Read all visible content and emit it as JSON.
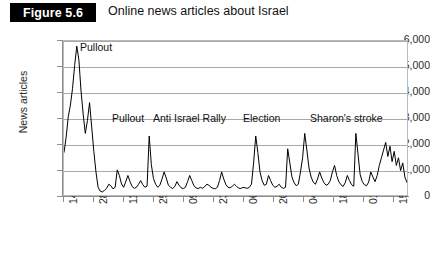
{
  "header": {
    "figure_badge": "Figure 5.6",
    "title": "Online news articles about Israel"
  },
  "chart_data": {
    "type": "line",
    "title": "Online news articles about Israel",
    "xlabel": "",
    "ylabel": "News articles",
    "ylim": [
      0,
      6000
    ],
    "ytick_labels": [
      "0",
      "1,000",
      "2,000",
      "3,000",
      "4,000",
      "5,000",
      "6,000"
    ],
    "ytick_values": [
      0,
      1000,
      2000,
      3000,
      4000,
      5000,
      6000
    ],
    "grid": "horizontal",
    "legend": "none",
    "xtick_labels": [
      "14/08/2005",
      "28/08/2005",
      "11/09/2005",
      "25/09/2005",
      "09/10/2005",
      "23/10/2005",
      "06/11/2005",
      "20/11/2005",
      "04/12/2005",
      "18/12/2005",
      "01/01/2006",
      "15/01/2006"
    ],
    "x_interval_days": 14,
    "x_start": "14/08/2005",
    "x_end": "22/01/2006",
    "n_points": 162,
    "series": [
      {
        "name": "News articles",
        "color": "#000000",
        "values": [
          1650,
          2250,
          3050,
          3500,
          4150,
          5050,
          5800,
          5250,
          4050,
          3150,
          2400,
          2900,
          3600,
          2650,
          1700,
          900,
          300,
          150,
          120,
          180,
          260,
          420,
          360,
          240,
          300,
          980,
          760,
          430,
          300,
          520,
          760,
          520,
          330,
          260,
          300,
          420,
          560,
          400,
          300,
          350,
          2300,
          1180,
          640,
          420,
          300,
          380,
          620,
          900,
          660,
          380,
          300,
          250,
          330,
          520,
          380,
          280,
          250,
          300,
          520,
          760,
          560,
          360,
          280,
          250,
          300,
          260,
          320,
          420,
          380,
          300,
          260,
          240,
          300,
          560,
          900,
          620,
          400,
          300,
          280,
          340,
          420,
          330,
          270,
          250,
          300,
          280,
          260,
          300,
          420,
          1250,
          2300,
          1650,
          900,
          560,
          380,
          420,
          760,
          560,
          380,
          300,
          340,
          420,
          300,
          260,
          300,
          1800,
          1250,
          700,
          480,
          360,
          420,
          900,
          1450,
          2400,
          1750,
          1050,
          700,
          500,
          420,
          620,
          900,
          660,
          480,
          380,
          420,
          560,
          900,
          1150,
          760,
          520,
          400,
          330,
          480,
          760,
          560,
          400,
          340,
          2400,
          1600,
          800,
          520,
          400,
          360,
          500,
          900,
          700,
          520,
          760,
          1150,
          1450,
          1750,
          2050,
          1500,
          1900,
          1300,
          1700,
          1150,
          1450,
          950,
          1250,
          700,
          480
        ]
      }
    ],
    "annotations": [
      {
        "label": "Pullout",
        "x_index": 7,
        "y_value": 5800
      },
      {
        "label": "Pullout",
        "x_index": 40,
        "y_value": 2300
      },
      {
        "label": "Anti Israel Rally",
        "x_index": 90,
        "y_value": 2300
      },
      {
        "label": "Election",
        "x_index": 113,
        "y_value": 2400
      },
      {
        "label": "Sharon's stroke",
        "x_index": 137,
        "y_value": 2400
      }
    ]
  },
  "annotation_layout": [
    {
      "name": "annot-pullout-1",
      "left": 80,
      "top": 15
    },
    {
      "name": "annot-pullout-2",
      "left": 112,
      "top": 86
    },
    {
      "name": "annot-anti-israel-rally",
      "left": 153,
      "top": 86
    },
    {
      "name": "annot-election",
      "left": 243,
      "top": 86
    },
    {
      "name": "annot-sharons-stroke",
      "left": 310,
      "top": 86
    }
  ]
}
